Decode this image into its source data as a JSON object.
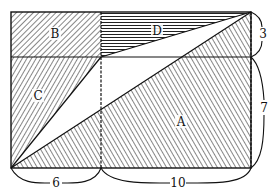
{
  "figure": {
    "regions": {
      "A": "A",
      "B": "B",
      "C": "C",
      "D": "D"
    },
    "dimensions": {
      "bottom_left": "6",
      "bottom_right": "10",
      "right_top": "3",
      "right_bottom": "7"
    }
  }
}
